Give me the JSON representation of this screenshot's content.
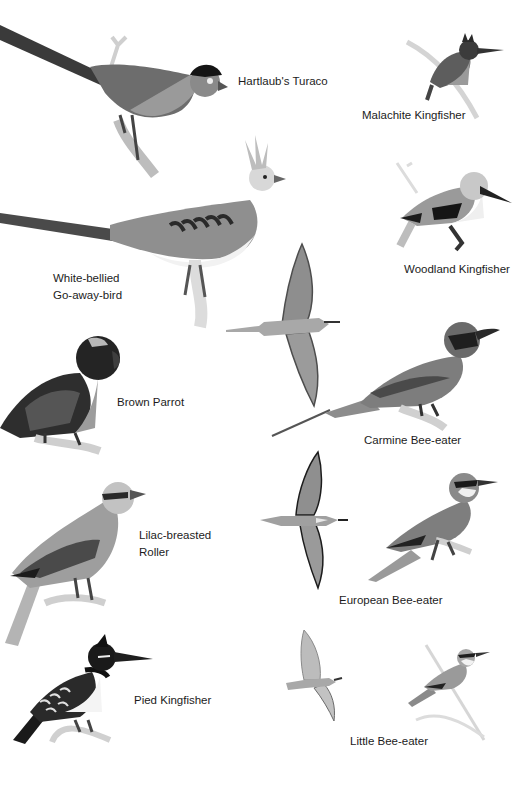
{
  "plate": {
    "species": [
      {
        "id": "hartlaubs-turaco",
        "label": "Hartlaub's Turaco"
      },
      {
        "id": "malachite-kingfisher",
        "label": "Malachite Kingfisher"
      },
      {
        "id": "white-bellied-go-away-bird",
        "label_line1": "White-bellied",
        "label_line2": "Go-away-bird"
      },
      {
        "id": "woodland-kingfisher",
        "label": "Woodland Kingfisher"
      },
      {
        "id": "brown-parrot",
        "label": "Brown Parrot"
      },
      {
        "id": "carmine-bee-eater",
        "label": "Carmine Bee-eater"
      },
      {
        "id": "lilac-breasted-roller",
        "label_line1": "Lilac-breasted",
        "label_line2": "Roller"
      },
      {
        "id": "european-bee-eater",
        "label": "European Bee-eater"
      },
      {
        "id": "pied-kingfisher",
        "label": "Pied Kingfisher"
      },
      {
        "id": "little-bee-eater",
        "label": "Little Bee-eater"
      }
    ]
  }
}
